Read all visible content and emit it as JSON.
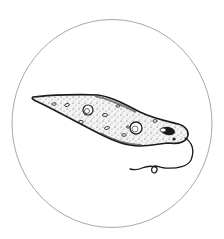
{
  "illustration": {
    "subject": "euglena",
    "frame_shape": "circle",
    "colors": {
      "background": "#ffffff",
      "frame_stroke": "#a8a8a8",
      "ink": "#1a1a1a",
      "body_fill": "#f2f2f2"
    }
  }
}
